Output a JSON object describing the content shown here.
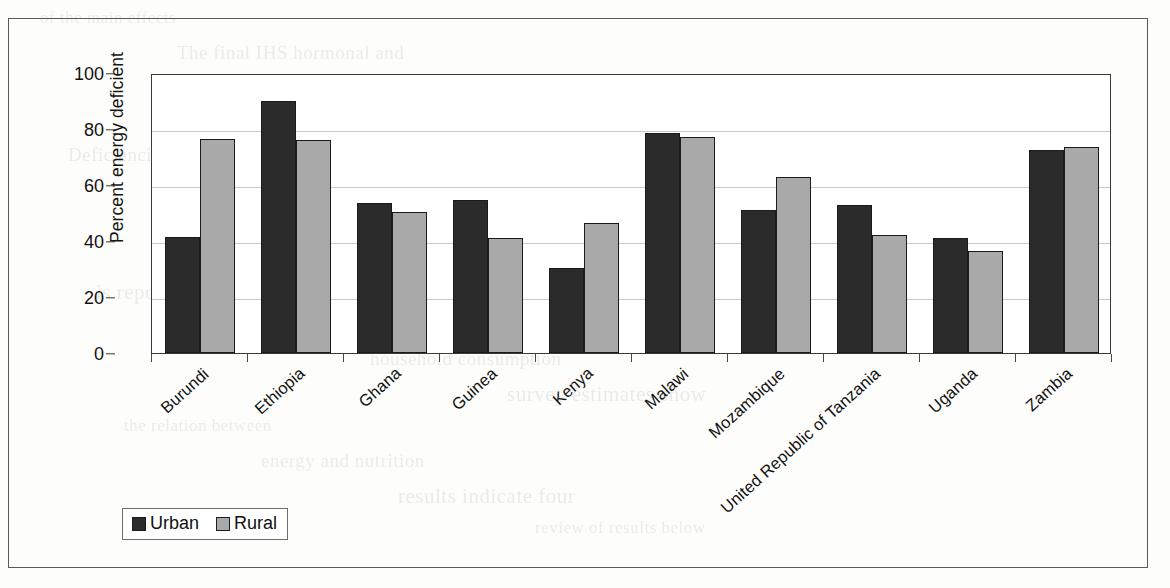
{
  "chart_data": {
    "type": "bar",
    "title": "",
    "xlabel": "",
    "ylabel": "Percent energy deficient",
    "ylim": [
      0,
      100
    ],
    "yticks": [
      0,
      20,
      40,
      60,
      80,
      100
    ],
    "grid": true,
    "legend_position": "bottom-left",
    "categories": [
      "Burundi",
      "Ethiopia",
      "Ghana",
      "Guinea",
      "Kenya",
      "Malawi",
      "Mozambique",
      "United Republic of Tanzania",
      "Uganda",
      "Zambia"
    ],
    "series": [
      {
        "name": "Urban",
        "color": "#2b2b2b",
        "values": [
          41.5,
          90.0,
          53.5,
          54.5,
          30.5,
          78.5,
          51.0,
          53.0,
          41.0,
          72.5
        ]
      },
      {
        "name": "Rural",
        "color": "#a9a9a9",
        "values": [
          76.5,
          76.0,
          50.5,
          41.0,
          46.5,
          77.0,
          63.0,
          42.0,
          36.5,
          73.5
        ]
      }
    ]
  },
  "legend": {
    "items": [
      {
        "label": "Urban",
        "swatch": "urban"
      },
      {
        "label": "Rural",
        "swatch": "rural"
      }
    ]
  },
  "background_text": [
    "of the main effects",
    "The final IHS hormonal and",
    "are to be carried over",
    "and second-round of estimates",
    "Deficiencies in calories and",
    "the model of the prevalence of",
    "on the estimated prevalence rates",
    "analysis deficient population",
    "is reported in the data",
    "for a given country",
    "household consumption",
    "survey estimates show",
    "the relation between",
    "energy and nutrition",
    "results indicate four",
    "review of results below"
  ]
}
